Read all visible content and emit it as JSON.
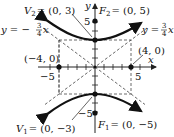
{
  "figure": {
    "type": "hyperbola-graph",
    "equation": "y^2/9 - x^2/16 = 1",
    "origin_px": [
      95,
      67
    ],
    "unit_px": 9,
    "colors": {
      "curve": "#111111",
      "axis": "#222222",
      "dashed": "#444444",
      "point": "#111111"
    }
  },
  "axes": {
    "x_label": "x",
    "y_label": "y",
    "x_tick_labels": [
      {
        "value": -5,
        "text": "−5"
      },
      {
        "value": 5,
        "text": "5"
      }
    ],
    "y_tick_labels": [
      {
        "value": 5,
        "text": "5"
      },
      {
        "value": -5,
        "text": "−5"
      }
    ]
  },
  "labels": {
    "v2": {
      "name": "V",
      "sub": "2",
      "coords": "= (0, 3)"
    },
    "f2": {
      "name": "F",
      "sub": "2",
      "coords": "= (0, 5)"
    },
    "v1": {
      "name": "V",
      "sub": "1",
      "coords": "= (0, −3)"
    },
    "f1": {
      "name": "F",
      "sub": "1",
      "coords": "= (0, −5)"
    },
    "point_left": "(−4, 0)",
    "point_right": "(4, 0)",
    "asymptote_neg": {
      "lhs": "y = −",
      "num": "3",
      "den": "4",
      "var": "x"
    },
    "asymptote_pos": {
      "lhs": "y = ",
      "num": "3",
      "den": "4",
      "var": "x"
    }
  },
  "points": [
    {
      "name": "V2",
      "x": 0,
      "y": 3
    },
    {
      "name": "F2",
      "x": 0,
      "y": 5
    },
    {
      "name": "V1",
      "x": 0,
      "y": -3
    },
    {
      "name": "F1",
      "x": 0,
      "y": -5
    },
    {
      "name": "left",
      "x": -4,
      "y": 0
    },
    {
      "name": "right",
      "x": 4,
      "y": 0
    }
  ]
}
